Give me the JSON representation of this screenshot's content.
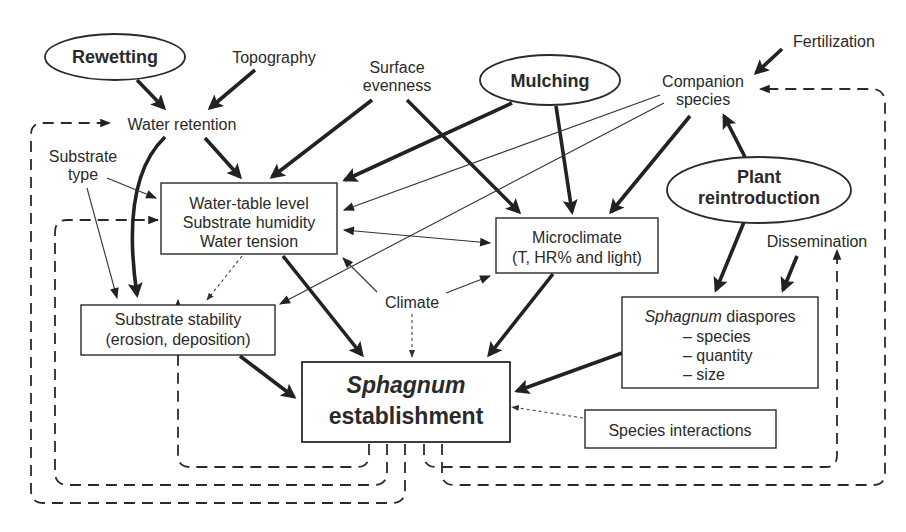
{
  "diagram": {
    "type": "flowchart",
    "interventions": {
      "rewetting": "Rewetting",
      "mulching": "Mulching",
      "plant_reintroduction_line1": "Plant",
      "plant_reintroduction_line2": "reintroduction"
    },
    "factors": {
      "topography": "Topography",
      "surface_evenness_line1": "Surface",
      "surface_evenness_line2": "evenness",
      "fertilization": "Fertilization",
      "companion_species_line1": "Companion",
      "companion_species_line2": "species",
      "water_retention": "Water retention",
      "substrate_type_line1": "Substrate",
      "substrate_type_line2": "type",
      "climate": "Climate",
      "dissemination": "Dissemination"
    },
    "boxes": {
      "water_table": [
        "Water-table level",
        "Substrate humidity",
        "Water tension"
      ],
      "microclimate": [
        "Microclimate",
        "(T, HR% and light)"
      ],
      "substrate_stability": [
        "Substrate stability",
        "(erosion, deposition)"
      ],
      "diaspores_title_italic": "Sphagnum",
      "diaspores_title_rest": " diaspores",
      "diaspores_items": [
        "– species",
        "– quantity",
        "– size"
      ],
      "species_interactions": "Species interactions",
      "establishment_line1": "Sphagnum",
      "establishment_line2": "establishment"
    },
    "edges": [
      {
        "from": "Rewetting",
        "to": "Water retention",
        "style": "thick"
      },
      {
        "from": "Topography",
        "to": "Water retention",
        "style": "thick"
      },
      {
        "from": "Water retention",
        "to": "Water-table level",
        "style": "thick"
      },
      {
        "from": "Water retention",
        "to": "Substrate stability",
        "style": "thick"
      },
      {
        "from": "Surface evenness",
        "to": "Water-table level",
        "style": "thick"
      },
      {
        "from": "Surface evenness",
        "to": "Microclimate",
        "style": "thick"
      },
      {
        "from": "Mulching",
        "to": "Water-table level",
        "style": "thick"
      },
      {
        "from": "Mulching",
        "to": "Microclimate",
        "style": "thick"
      },
      {
        "from": "Companion species",
        "to": "Water-table level",
        "style": "thin"
      },
      {
        "from": "Companion species",
        "to": "Substrate stability",
        "style": "thin"
      },
      {
        "from": "Companion species",
        "to": "Microclimate",
        "style": "thick"
      },
      {
        "from": "Fertilization",
        "to": "Companion species",
        "style": "thick"
      },
      {
        "from": "Plant reintroduction",
        "to": "Companion species",
        "style": "thick"
      },
      {
        "from": "Plant reintroduction",
        "to": "Sphagnum diaspores",
        "style": "thick"
      },
      {
        "from": "Dissemination",
        "to": "Sphagnum diaspores",
        "style": "thick"
      },
      {
        "from": "Substrate type",
        "to": "Water-table level",
        "style": "thin"
      },
      {
        "from": "Substrate type",
        "to": "Substrate stability",
        "style": "thin"
      },
      {
        "from": "Water-table level",
        "to": "Microclimate",
        "style": "thin-bidirectional"
      },
      {
        "from": "Water-table level",
        "to": "Substrate stability",
        "style": "dotted"
      },
      {
        "from": "Climate",
        "to": "Water-table level",
        "style": "thin"
      },
      {
        "from": "Climate",
        "to": "Microclimate",
        "style": "thin"
      },
      {
        "from": "Climate",
        "to": "Sphagnum establishment",
        "style": "dotted"
      },
      {
        "from": "Water-table level",
        "to": "Sphagnum establishment",
        "style": "thick"
      },
      {
        "from": "Microclimate",
        "to": "Sphagnum establishment",
        "style": "thick"
      },
      {
        "from": "Substrate stability",
        "to": "Sphagnum establishment",
        "style": "thick"
      },
      {
        "from": "Sphagnum diaspores",
        "to": "Sphagnum establishment",
        "style": "thick"
      },
      {
        "from": "Species interactions",
        "to": "Sphagnum establishment",
        "style": "dotted"
      },
      {
        "from": "Sphagnum establishment",
        "to": "Substrate stability",
        "style": "dashed-feedback"
      },
      {
        "from": "Sphagnum establishment",
        "to": "Water-table level",
        "style": "dashed-feedback"
      },
      {
        "from": "Sphagnum establishment",
        "to": "Water retention",
        "style": "dashed-feedback"
      },
      {
        "from": "Sphagnum establishment",
        "to": "Dissemination",
        "style": "dashed-feedback"
      },
      {
        "from": "Sphagnum establishment",
        "to": "Companion species",
        "style": "dashed-feedback"
      }
    ]
  }
}
